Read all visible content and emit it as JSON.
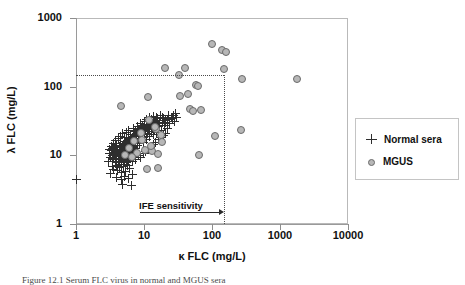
{
  "figure": {
    "caption": "Figure 12.1  Serum FLC virus in normal and MGUS sera"
  },
  "legend": {
    "position": "right",
    "items": [
      {
        "symbol": "plus-marker",
        "label": "Normal sera"
      },
      {
        "symbol": "circle-marker",
        "label": "MGUS"
      }
    ]
  },
  "annotations": [
    {
      "name": "ife-sensitivity",
      "text": "IFE sensitivity",
      "x": 150,
      "y": 150
    }
  ],
  "chart_data": {
    "type": "scatter",
    "title": "",
    "xlabel": "κ FLC (mg/L)",
    "ylabel": "λ FLC (mg/L)",
    "xscale": "log",
    "yscale": "log",
    "xlim": [
      1,
      10000
    ],
    "ylim": [
      1,
      1000
    ],
    "xticks": [
      1,
      10,
      100,
      1000,
      10000
    ],
    "yticks": [
      1,
      10,
      100,
      1000
    ],
    "xticklabels": [
      "1",
      "10",
      "100",
      "1000",
      "10000"
    ],
    "yticklabels": [
      "1",
      "10",
      "100",
      "1000"
    ],
    "grid": false,
    "reference_lines": [
      {
        "name": "ife-horizontal",
        "orientation": "horizontal",
        "value": 150,
        "x_from": 1,
        "x_to": 150,
        "style": "dotted"
      },
      {
        "name": "ife-vertical",
        "orientation": "vertical",
        "value": 150,
        "y_from": 1,
        "y_to": 150,
        "style": "dotted"
      }
    ],
    "series": [
      {
        "name": "Normal sera",
        "marker": "+",
        "color": "#2e2e2e",
        "points": [
          [
            1.0,
            4.5
          ],
          [
            3.1,
            10.5
          ],
          [
            3.2,
            9.4
          ],
          [
            3.3,
            11.8
          ],
          [
            3.4,
            8.6
          ],
          [
            3.5,
            12.5
          ],
          [
            3.5,
            10.0
          ],
          [
            3.6,
            9.0
          ],
          [
            3.7,
            13.0
          ],
          [
            3.7,
            11.0
          ],
          [
            3.8,
            8.2
          ],
          [
            3.9,
            10.8
          ],
          [
            3.9,
            14.0
          ],
          [
            4.0,
            9.6
          ],
          [
            4.0,
            12.2
          ],
          [
            4.1,
            11.4
          ],
          [
            4.2,
            10.2
          ],
          [
            4.2,
            7.8
          ],
          [
            4.3,
            13.5
          ],
          [
            4.4,
            9.1
          ],
          [
            4.4,
            11.9
          ],
          [
            4.5,
            10.6
          ],
          [
            4.5,
            15.0
          ],
          [
            4.6,
            8.8
          ],
          [
            4.6,
            12.8
          ],
          [
            4.7,
            11.2
          ],
          [
            4.8,
            9.8
          ],
          [
            4.8,
            13.8
          ],
          [
            4.9,
            10.4
          ],
          [
            5.0,
            12.0
          ],
          [
            5.0,
            8.4
          ],
          [
            5.1,
            14.5
          ],
          [
            5.1,
            10.9
          ],
          [
            5.2,
            12.6
          ],
          [
            5.3,
            9.3
          ],
          [
            5.3,
            16.0
          ],
          [
            5.4,
            11.6
          ],
          [
            5.5,
            13.2
          ],
          [
            5.5,
            10.1
          ],
          [
            5.6,
            15.5
          ],
          [
            5.7,
            12.1
          ],
          [
            5.7,
            9.0
          ],
          [
            5.8,
            14.2
          ],
          [
            5.9,
            11.0
          ],
          [
            6.0,
            13.0
          ],
          [
            6.0,
            17.0
          ],
          [
            6.1,
            10.3
          ],
          [
            6.2,
            15.2
          ],
          [
            6.3,
            12.4
          ],
          [
            6.4,
            18.0
          ],
          [
            6.4,
            11.1
          ],
          [
            6.5,
            14.0
          ],
          [
            6.6,
            16.5
          ],
          [
            6.7,
            12.9
          ],
          [
            6.8,
            10.7
          ],
          [
            6.9,
            19.0
          ],
          [
            7.0,
            15.0
          ],
          [
            7.0,
            13.4
          ],
          [
            7.1,
            17.5
          ],
          [
            7.2,
            11.5
          ],
          [
            7.3,
            20.0
          ],
          [
            7.4,
            14.8
          ],
          [
            7.5,
            16.2
          ],
          [
            7.6,
            12.7
          ],
          [
            7.7,
            21.0
          ],
          [
            7.8,
            18.5
          ],
          [
            7.9,
            15.6
          ],
          [
            8.0,
            13.8
          ],
          [
            8.1,
            22.0
          ],
          [
            8.2,
            17.0
          ],
          [
            8.3,
            19.5
          ],
          [
            8.5,
            15.0
          ],
          [
            8.6,
            23.5
          ],
          [
            8.8,
            20.5
          ],
          [
            9.0,
            16.8
          ],
          [
            9.2,
            25.0
          ],
          [
            9.4,
            18.2
          ],
          [
            9.6,
            22.0
          ],
          [
            9.8,
            15.4
          ],
          [
            10.0,
            26.0
          ],
          [
            10.2,
            19.8
          ],
          [
            10.5,
            23.0
          ],
          [
            10.8,
            17.2
          ],
          [
            11.0,
            28.0
          ],
          [
            11.3,
            21.0
          ],
          [
            11.6,
            24.5
          ],
          [
            12.0,
            18.6
          ],
          [
            12.4,
            30.0
          ],
          [
            12.8,
            22.5
          ],
          [
            13.2,
            26.5
          ],
          [
            13.6,
            20.0
          ],
          [
            14.0,
            32.0
          ],
          [
            14.5,
            24.0
          ],
          [
            15.0,
            28.0
          ],
          [
            15.5,
            21.5
          ],
          [
            16.0,
            34.0
          ],
          [
            16.5,
            26.0
          ],
          [
            17.0,
            30.0
          ],
          [
            18.0,
            23.0
          ],
          [
            19.0,
            36.0
          ],
          [
            20.0,
            27.5
          ],
          [
            21.0,
            32.0
          ],
          [
            22.0,
            25.0
          ],
          [
            23.0,
            38.0
          ],
          [
            24.0,
            29.0
          ],
          [
            26.0,
            34.0
          ],
          [
            28.0,
            31.0
          ],
          [
            30.0,
            36.0
          ],
          [
            3.4,
            6.8
          ],
          [
            3.6,
            6.2
          ],
          [
            3.9,
            7.0
          ],
          [
            4.1,
            6.0
          ],
          [
            4.4,
            6.6
          ],
          [
            4.7,
            5.6
          ],
          [
            5.0,
            6.9
          ],
          [
            5.4,
            5.9
          ],
          [
            5.8,
            7.2
          ],
          [
            6.2,
            6.4
          ],
          [
            4.0,
            4.8
          ],
          [
            4.6,
            4.4
          ],
          [
            5.2,
            5.0
          ],
          [
            6.0,
            4.6
          ],
          [
            6.8,
            5.2
          ],
          [
            4.8,
            3.7
          ],
          [
            6.5,
            3.6
          ],
          [
            3.2,
            5.4
          ],
          [
            3.0,
            8.0
          ],
          [
            3.1,
            12.0
          ],
          [
            3.3,
            13.6
          ],
          [
            3.6,
            15.0
          ],
          [
            3.8,
            16.5
          ],
          [
            4.2,
            17.5
          ],
          [
            4.5,
            19.0
          ],
          [
            4.9,
            20.5
          ],
          [
            5.2,
            18.0
          ],
          [
            5.6,
            21.5
          ],
          [
            6.0,
            23.0
          ],
          [
            6.4,
            20.0
          ],
          [
            7.0,
            24.5
          ],
          [
            7.5,
            22.0
          ],
          [
            8.0,
            26.5
          ],
          [
            8.4,
            24.0
          ],
          [
            9.0,
            29.0
          ],
          [
            9.5,
            27.0
          ],
          [
            10.0,
            31.0
          ],
          [
            11.0,
            33.0
          ],
          [
            12.0,
            35.0
          ],
          [
            13.0,
            33.5
          ],
          [
            14.0,
            37.0
          ],
          [
            15.5,
            35.5
          ],
          [
            17.5,
            38.5
          ],
          [
            19.5,
            34.0
          ],
          [
            4.3,
            8.0
          ],
          [
            4.7,
            7.4
          ],
          [
            5.1,
            8.6
          ],
          [
            5.5,
            7.9
          ],
          [
            5.9,
            8.3
          ],
          [
            6.3,
            9.2
          ],
          [
            6.7,
            8.1
          ],
          [
            7.1,
            9.5
          ],
          [
            7.6,
            8.7
          ],
          [
            8.2,
            10.0
          ],
          [
            8.9,
            9.4
          ],
          [
            9.7,
            10.6
          ],
          [
            10.6,
            11.3
          ],
          [
            11.5,
            12.2
          ],
          [
            12.6,
            13.0
          ],
          [
            13.8,
            14.2
          ],
          [
            15.0,
            15.5
          ],
          [
            16.2,
            16.8
          ],
          [
            17.6,
            18.0
          ],
          [
            19.2,
            19.4
          ],
          [
            21.0,
            21.0
          ],
          [
            5.0,
            14.5
          ],
          [
            5.7,
            16.0
          ],
          [
            6.5,
            17.8
          ],
          [
            7.3,
            19.2
          ],
          [
            8.6,
            21.8
          ],
          [
            9.9,
            23.8
          ],
          [
            11.2,
            25.5
          ],
          [
            12.2,
            27.2
          ],
          [
            13.4,
            29.5
          ],
          [
            14.8,
            31.5
          ],
          [
            16.8,
            29.0
          ],
          [
            18.5,
            32.5
          ],
          [
            20.5,
            30.5
          ],
          [
            22.5,
            33.0
          ],
          [
            25.0,
            35.0
          ],
          [
            27.0,
            37.5
          ],
          [
            29.0,
            40.0
          ]
        ]
      },
      {
        "name": "MGUS",
        "marker": "o",
        "color": "#b7b7b7",
        "points": [
          [
            4.6,
            53
          ],
          [
            11.5,
            70
          ],
          [
            20.5,
            190
          ],
          [
            33,
            150
          ],
          [
            40,
            185
          ],
          [
            58,
            105
          ],
          [
            62,
            102
          ],
          [
            100,
            420
          ],
          [
            140,
            345
          ],
          [
            160,
            320
          ],
          [
            150,
            180
          ],
          [
            280,
            130
          ],
          [
            1750,
            128
          ],
          [
            34,
            72
          ],
          [
            44,
            78
          ],
          [
            47,
            47
          ],
          [
            52,
            44
          ],
          [
            70,
            46
          ],
          [
            110,
            19
          ],
          [
            270,
            23
          ],
          [
            65,
            10.0
          ],
          [
            12,
            33
          ],
          [
            15,
            24
          ],
          [
            14.5,
            26
          ],
          [
            9.5,
            17
          ],
          [
            7.2,
            16
          ],
          [
            6.0,
            13
          ],
          [
            5.2,
            10.2
          ],
          [
            8.0,
            10.8
          ],
          [
            10.5,
            12.0
          ],
          [
            13,
            11.4
          ],
          [
            16,
            10.4
          ],
          [
            11,
            6.3
          ],
          [
            16,
            6.6
          ],
          [
            17.5,
            20
          ],
          [
            18.5,
            15.5
          ],
          [
            12.5,
            13.8
          ],
          [
            9.0,
            21
          ],
          [
            6.6,
            9.6
          ]
        ]
      }
    ]
  }
}
